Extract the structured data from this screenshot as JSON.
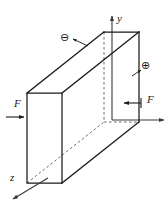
{
  "figure": {
    "background_color": "#ffffff",
    "line_color": "#1a1a1a",
    "hidden_line_color": "#5a5a5a",
    "width": 168,
    "height": 204
  },
  "axes": {
    "y": {
      "label": "y",
      "direction": "up",
      "origin": [
        112,
        120
      ],
      "tip": [
        112,
        14
      ]
    },
    "x": {
      "label": "",
      "direction": "right",
      "origin": [
        112,
        120
      ],
      "tip": [
        166,
        120
      ]
    },
    "z": {
      "label": "z",
      "direction": "lower-left",
      "origin": [
        48,
        178
      ],
      "tip": [
        11,
        200
      ]
    }
  },
  "solid": {
    "shape": "rectangular-slab",
    "front_face": {
      "top_left": [
        27,
        93
      ],
      "top_right": [
        62,
        93
      ],
      "bottom_right": [
        62,
        183
      ],
      "bottom_left": [
        27,
        183
      ]
    },
    "back_face": {
      "top_left": [
        104,
        32
      ],
      "top_right": [
        139,
        32
      ],
      "bottom_right": [
        139,
        122
      ],
      "bottom_left": [
        104,
        122
      ]
    }
  },
  "loads": [
    {
      "name": "left-force",
      "label": "F",
      "arrow_direction": "right",
      "sense": "compressive",
      "label_position": [
        18,
        104
      ],
      "arrow_start": [
        6,
        117
      ],
      "arrow_end": [
        26,
        117
      ]
    },
    {
      "name": "right-force",
      "label": "F",
      "arrow_direction": "left",
      "sense": "compressive",
      "label_position": [
        150,
        100
      ],
      "arrow_start": [
        141,
        103
      ],
      "arrow_end": [
        122,
        103
      ]
    }
  ],
  "annotations": [
    {
      "name": "negative-charge",
      "symbol": "⊖",
      "meaning": "negative surface charge",
      "symbol_position": [
        64,
        37
      ],
      "leader_start": [
        72,
        38
      ],
      "leader_end": [
        87,
        45
      ]
    },
    {
      "name": "positive-charge",
      "symbol": "⊕",
      "meaning": "positive surface charge",
      "symbol_position": [
        146,
        65
      ],
      "leader_start": [
        143,
        68
      ],
      "leader_end": [
        133,
        75
      ]
    }
  ]
}
